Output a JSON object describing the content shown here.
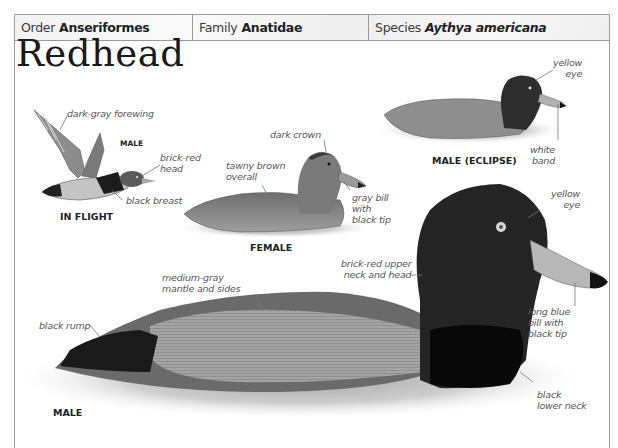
{
  "header": {
    "order_label": "Order",
    "order_value": "Anseriformes",
    "family_label": "Family",
    "family_value": "Anatidae",
    "species_label": "Species",
    "species_value": "Aythya americana"
  },
  "title": "Redhead",
  "figures": {
    "in_flight": {
      "caption": "IN FLIGHT",
      "sex_label": "MALE",
      "labels": {
        "forewing": "dark-gray forewing",
        "head_l1": "brick-red",
        "head_l2": "head",
        "breast": "black breast"
      }
    },
    "female": {
      "caption": "FEMALE",
      "labels": {
        "crown": "dark crown",
        "overall_l1": "tawny brown",
        "overall_l2": "overall",
        "bill_l1": "gray bill",
        "bill_l2": "with",
        "bill_l3": "black tip"
      }
    },
    "male_eclipse": {
      "caption": "MALE (ECLIPSE)",
      "labels": {
        "eye_l1": "yellow",
        "eye_l2": "eye",
        "band_l1": "white",
        "band_l2": "band"
      }
    },
    "male": {
      "caption": "MALE",
      "labels": {
        "eye_l1": "yellow",
        "eye_l2": "eye",
        "neck_l1": "brick-red upper",
        "neck_l2": "neck and head",
        "mantle_l1": "medium-gray",
        "mantle_l2": "mantle and sides",
        "rump": "black rump",
        "bill_l1": "long blue",
        "bill_l2": "bill with",
        "bill_l3": "black tip",
        "lower_neck_l1": "black",
        "lower_neck_l2": "lower neck"
      }
    }
  }
}
